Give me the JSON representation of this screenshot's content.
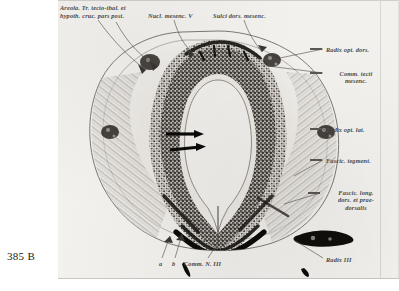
{
  "plate": {
    "caption": "385 B"
  },
  "figure": {
    "type": "histological-cross-section",
    "background_color": "#f2f1ee",
    "ink_color": "#4a4846"
  },
  "labels": {
    "top_left_line1": "Areola. Tr. tecto-thal. et",
    "top_left_line2": "hypoth. cruc. pars post.",
    "nucl_mesenc_v": "Nucl. mesenc. V",
    "sulci_dors_mesenc": "Sulci dors. mesenc.",
    "radix_opt_dors": "Radix opt. dors.",
    "comm_tecti_mesenc": "Comm. tecti\nmesenc.",
    "radix_opt_lat": "Radix opt. lat.",
    "fascic_tegment": "Fascic. tegment.",
    "fascic_long_dors": "Fascic. long.\ndors. et prae-\ndorsalis",
    "radix_iii": "Radix III",
    "marker_a": "a",
    "marker_b": "b",
    "comm_n_iii": "Comm. N. III"
  },
  "annotations": {
    "arrow_upper": "arrow pointing to ventricle wall",
    "arrow_lower": "arrow pointing to ventricle wall"
  }
}
